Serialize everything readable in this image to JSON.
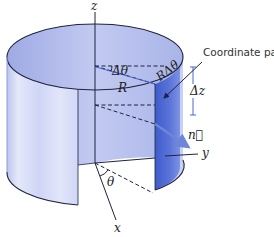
{
  "figure": {
    "labels": {
      "z_axis": "z",
      "y_axis": "y",
      "x_axis": "x",
      "delta_theta": "Δθ",
      "r_delta_theta": "RΔθ",
      "radius": "R",
      "delta_z": "Δz",
      "normal": "n⃗",
      "theta": "θ",
      "callout": "Coordinate patch"
    },
    "colors": {
      "surface_light": "#dfe3f7",
      "surface_mid": "#b9c2ee",
      "surface_inner": "#9fabe6",
      "patch": "#4a66d4",
      "outline": "#1f2340",
      "normal_arrow": "#6f86d8"
    }
  }
}
